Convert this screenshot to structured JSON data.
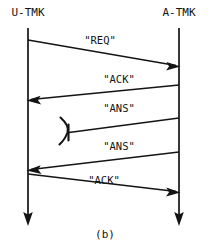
{
  "figure": {
    "caption": "(b)",
    "background_color": "#ffffff",
    "ink_color": "#141414",
    "width": 215,
    "height": 246
  },
  "lifelines": [
    {
      "id": "u-tmk",
      "label": "U-TMK",
      "x": 28,
      "label_x": 28,
      "label_y": 16,
      "top_y": 28,
      "bottom_y": 215
    },
    {
      "id": "a-tmk",
      "label": "A-TMK",
      "x": 179,
      "label_x": 179,
      "label_y": 16,
      "top_y": 28,
      "bottom_y": 215
    }
  ],
  "messages": [
    {
      "id": "msg-req",
      "label": "\"REQ\"",
      "direction": "left-to-right",
      "from": "u-tmk",
      "to": "a-tmk",
      "x1": 28,
      "y1": 40,
      "x2": 179,
      "y2": 66,
      "lost": false,
      "label_x": 100,
      "label_y": 44
    },
    {
      "id": "msg-ack-1",
      "label": "\"ACK\"",
      "direction": "right-to-left",
      "from": "a-tmk",
      "to": "u-tmk",
      "x1": 179,
      "y1": 85,
      "x2": 28,
      "y2": 100,
      "lost": false,
      "label_x": 119,
      "label_y": 83
    },
    {
      "id": "msg-ans-1",
      "label": "\"ANS\"",
      "direction": "right-to-left",
      "from": "a-tmk",
      "to": "u-tmk",
      "x1": 179,
      "y1": 118,
      "x2": 68,
      "y2": 133,
      "lost": true,
      "label_x": 119,
      "label_y": 112
    },
    {
      "id": "msg-ans-2",
      "label": "\"ANS\"",
      "direction": "right-to-left",
      "from": "a-tmk",
      "to": "u-tmk",
      "x1": 179,
      "y1": 152,
      "x2": 28,
      "y2": 170,
      "lost": false,
      "label_x": 119,
      "label_y": 150
    },
    {
      "id": "msg-ack-2",
      "label": "\"ACK\"",
      "direction": "left-to-right",
      "from": "u-tmk",
      "to": "a-tmk",
      "x1": 28,
      "y1": 174,
      "x2": 179,
      "y2": 192,
      "lost": false,
      "label_x": 104,
      "label_y": 184
    }
  ],
  "caption": {
    "text": "(b)",
    "x": 105,
    "y": 238
  }
}
